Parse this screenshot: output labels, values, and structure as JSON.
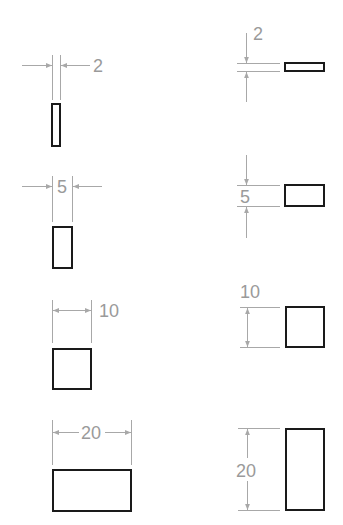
{
  "colors": {
    "background": "#ffffff",
    "dimension_line": "#a8a8a8",
    "dimension_text": "#9a9a9a",
    "shape_outline": "#1a1a1a"
  },
  "diagram": {
    "left_column": {
      "orientation": "horizontal-dimension",
      "items": [
        {
          "label": "2",
          "value": 2
        },
        {
          "label": "5",
          "value": 5
        },
        {
          "label": "10",
          "value": 10
        },
        {
          "label": "20",
          "value": 20
        }
      ]
    },
    "right_column": {
      "orientation": "vertical-dimension",
      "items": [
        {
          "label": "2",
          "value": 2
        },
        {
          "label": "5",
          "value": 5
        },
        {
          "label": "10",
          "value": 10
        },
        {
          "label": "20",
          "value": 20
        }
      ]
    }
  }
}
